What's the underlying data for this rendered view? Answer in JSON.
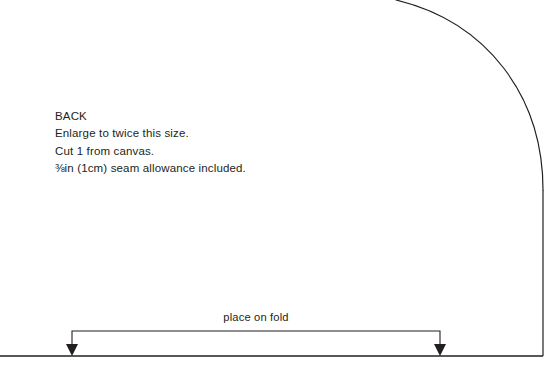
{
  "page": {
    "width": 549,
    "height": 371,
    "background": "#ffffff",
    "ink_color": "#231f20"
  },
  "annotations": {
    "piece_name": "BACK",
    "instruction_enlarge": "Enlarge to twice this size.",
    "instruction_cut": "Cut 1 from canvas.",
    "seam_fraction": "⅜",
    "seam_allowance_rest": "in (1cm) seam allowance included.",
    "seam_allowance_full": "⅜in (1cm) seam allowance included."
  },
  "fold_marker": {
    "label": "place on fold",
    "left_arrow_x": 72,
    "right_arrow_x": 440,
    "bracket_top_y": 331,
    "baseline_y": 356
  },
  "geometry": {
    "bottom_line": {
      "x1": 0,
      "y1": 356,
      "x2": 543,
      "y2": 356
    },
    "right_edge": {
      "x": 543,
      "y_top": 190,
      "y_bottom": 356
    },
    "curve": {
      "start": {
        "x": 396,
        "y": 0
      },
      "control1": {
        "x": 487,
        "y": 22
      },
      "control2": {
        "x": 543,
        "y": 96
      },
      "end": {
        "x": 543,
        "y": 190
      }
    },
    "stroke_width": 1.2
  },
  "chart_data": {
    "type": "table",
    "rows": [
      [
        "Piece",
        "BACK"
      ],
      [
        "Scale",
        "Enlarge to twice this size."
      ],
      [
        "Quantity",
        "Cut 1 from canvas."
      ],
      [
        "Seam allowance",
        "⅜in (1cm) seam allowance included."
      ],
      [
        "Edge marking",
        "place on fold"
      ]
    ]
  }
}
